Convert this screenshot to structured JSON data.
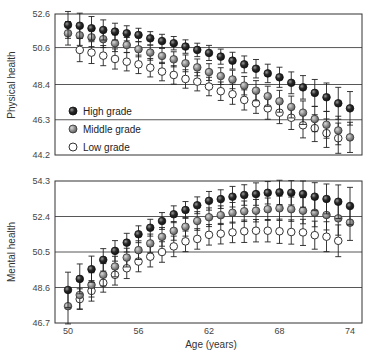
{
  "chart_data": [
    {
      "type": "scatter",
      "panel": "top",
      "title": "",
      "xlabel": "",
      "ylabel": "Physical health",
      "ylim": [
        44.2,
        52.6
      ],
      "yticks": [
        52.6,
        50.6,
        48.4,
        46.3,
        44.2
      ],
      "xlim": [
        49,
        75
      ],
      "grid": "horizontal",
      "x": [
        50,
        51,
        52,
        53,
        54,
        55,
        56,
        57,
        58,
        59,
        60,
        61,
        62,
        63,
        64,
        65,
        66,
        67,
        68,
        69,
        70,
        71,
        72,
        73,
        74
      ],
      "series": [
        {
          "name": "High grade",
          "values": [
            51.95,
            51.9,
            51.75,
            51.65,
            51.55,
            51.45,
            51.35,
            51.15,
            50.99,
            50.86,
            50.66,
            50.46,
            50.28,
            50.06,
            49.82,
            49.6,
            49.34,
            49.06,
            48.83,
            48.5,
            48.23,
            47.9,
            47.64,
            47.28,
            46.98
          ],
          "errors": [
            0.8,
            0.75,
            0.7,
            0.6,
            0.5,
            0.45,
            0.4,
            0.4,
            0.4,
            0.4,
            0.4,
            0.4,
            0.45,
            0.45,
            0.5,
            0.5,
            0.55,
            0.55,
            0.6,
            0.65,
            0.7,
            0.8,
            0.85,
            0.95,
            1.0
          ]
        },
        {
          "name": "Middle grade",
          "values": [
            51.45,
            51.33,
            51.21,
            51.1,
            50.86,
            50.75,
            50.5,
            50.3,
            50.1,
            49.9,
            49.66,
            49.42,
            49.14,
            48.9,
            48.7,
            48.33,
            48.03,
            47.7,
            47.4,
            47.06,
            46.72,
            46.34,
            46.0,
            45.66,
            45.25
          ],
          "errors": [
            0.7,
            0.6,
            0.55,
            0.5,
            0.5,
            0.45,
            0.45,
            0.45,
            0.45,
            0.45,
            0.5,
            0.5,
            0.5,
            0.5,
            0.55,
            0.55,
            0.6,
            0.6,
            0.65,
            0.65,
            0.7,
            0.75,
            0.8,
            0.85,
            0.9
          ]
        },
        {
          "name": "Low grade",
          "values": [
            null,
            50.46,
            50.3,
            50.12,
            49.92,
            49.76,
            49.6,
            49.4,
            49.17,
            48.97,
            48.73,
            48.57,
            48.28,
            48.0,
            47.82,
            47.48,
            47.28,
            46.98,
            46.72,
            46.42,
            45.97,
            45.8,
            45.5,
            45.2,
            null
          ],
          "errors": [
            0,
            0.7,
            0.65,
            0.6,
            0.6,
            0.55,
            0.55,
            0.55,
            0.55,
            0.55,
            0.55,
            0.55,
            0.55,
            0.55,
            0.6,
            0.6,
            0.6,
            0.65,
            0.65,
            0.7,
            0.75,
            0.8,
            0.85,
            0.9,
            0
          ]
        }
      ]
    },
    {
      "type": "scatter",
      "panel": "bottom",
      "title": "",
      "xlabel": "Age (years)",
      "ylabel": "Mental health",
      "ylim": [
        46.7,
        54.3
      ],
      "yticks": [
        54.3,
        52.4,
        50.5,
        48.6,
        46.7
      ],
      "xticks": [
        50,
        56,
        62,
        68,
        74
      ],
      "xlim": [
        49,
        75
      ],
      "grid": "horizontal",
      "x": [
        50,
        51,
        52,
        53,
        54,
        55,
        56,
        57,
        58,
        59,
        60,
        61,
        62,
        63,
        64,
        65,
        66,
        67,
        68,
        69,
        70,
        71,
        72,
        73,
        74
      ],
      "series": [
        {
          "name": "High grade",
          "values": [
            48.47,
            49.06,
            49.58,
            50.08,
            50.56,
            51.0,
            51.45,
            51.8,
            52.16,
            52.52,
            52.75,
            53.0,
            53.24,
            53.33,
            53.46,
            53.55,
            53.6,
            53.67,
            53.69,
            53.67,
            53.6,
            53.46,
            53.34,
            53.19,
            52.96
          ],
          "errors": [
            0.95,
            0.8,
            0.7,
            0.6,
            0.55,
            0.5,
            0.45,
            0.45,
            0.45,
            0.45,
            0.45,
            0.45,
            0.5,
            0.5,
            0.55,
            0.55,
            0.6,
            0.6,
            0.65,
            0.65,
            0.7,
            0.75,
            0.8,
            0.9,
            1.0
          ]
        },
        {
          "name": "Middle grade",
          "values": [
            47.6,
            48.2,
            48.74,
            49.28,
            49.72,
            50.2,
            50.6,
            50.96,
            51.31,
            51.63,
            51.85,
            52.16,
            52.36,
            52.47,
            52.6,
            52.68,
            52.71,
            52.79,
            52.84,
            52.79,
            52.71,
            52.6,
            52.48,
            52.3,
            52.07
          ],
          "errors": [
            0.95,
            0.75,
            0.65,
            0.6,
            0.55,
            0.5,
            0.5,
            0.5,
            0.5,
            0.5,
            0.5,
            0.5,
            0.5,
            0.5,
            0.55,
            0.55,
            0.6,
            0.6,
            0.65,
            0.65,
            0.7,
            0.75,
            0.8,
            0.9,
            0.95
          ]
        },
        {
          "name": "Low grade",
          "values": [
            null,
            47.98,
            48.42,
            48.85,
            49.28,
            49.63,
            49.99,
            50.25,
            50.5,
            50.8,
            51.07,
            51.2,
            51.42,
            51.48,
            51.55,
            51.61,
            51.64,
            51.64,
            51.61,
            51.57,
            51.55,
            51.4,
            51.32,
            51.1,
            null
          ],
          "errors": [
            0,
            0.55,
            0.55,
            0.5,
            0.55,
            0.55,
            0.55,
            0.55,
            0.55,
            0.55,
            0.55,
            0.55,
            0.55,
            0.55,
            0.55,
            0.6,
            0.6,
            0.6,
            0.65,
            0.65,
            0.7,
            0.75,
            0.8,
            0.85,
            0
          ]
        }
      ]
    }
  ],
  "legend": {
    "items": [
      {
        "label": "High grade",
        "marker": "filled-dark"
      },
      {
        "label": "Middle grade",
        "marker": "filled-grey"
      },
      {
        "label": "Low grade",
        "marker": "open-white"
      }
    ]
  },
  "colors": {
    "high": "#2a2a2a",
    "middle": "#8c8c8c",
    "low": "#ffffff",
    "axis": "#333333",
    "grid": "#444444"
  }
}
